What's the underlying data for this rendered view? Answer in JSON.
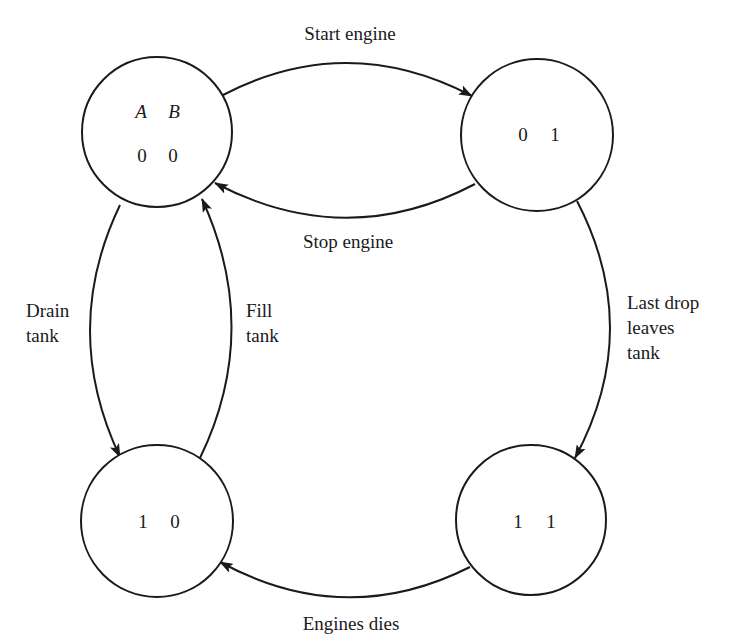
{
  "diagram": {
    "type": "state-transition-diagram",
    "header": {
      "var_a": "A",
      "var_b": "B"
    },
    "states": [
      {
        "id": "s00",
        "a": "0",
        "b": "0",
        "position": "top-left"
      },
      {
        "id": "s01",
        "a": "0",
        "b": "1",
        "position": "top-right"
      },
      {
        "id": "s10",
        "a": "1",
        "b": "0",
        "position": "bottom-left"
      },
      {
        "id": "s11",
        "a": "1",
        "b": "1",
        "position": "bottom-right"
      }
    ],
    "transitions": [
      {
        "from": "s00",
        "to": "s01",
        "label": "Start engine"
      },
      {
        "from": "s01",
        "to": "s00",
        "label": "Stop engine"
      },
      {
        "from": "s00",
        "to": "s10",
        "label_lines": [
          "Drain",
          "tank"
        ]
      },
      {
        "from": "s10",
        "to": "s00",
        "label_lines": [
          "Fill",
          "tank"
        ]
      },
      {
        "from": "s01",
        "to": "s11",
        "label_lines": [
          "Last drop",
          "leaves",
          "tank"
        ]
      },
      {
        "from": "s11",
        "to": "s10",
        "label": "Engines dies"
      }
    ],
    "colors": {
      "stroke": "#1a1a1a",
      "background": "#ffffff"
    }
  }
}
